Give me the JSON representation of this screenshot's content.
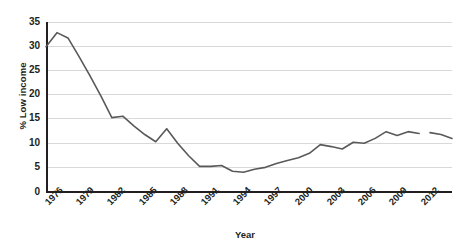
{
  "chart_data": {
    "type": "line",
    "title": "",
    "xlabel": "Year",
    "ylabel": "% Low income",
    "xlim": [
      1976,
      2013
    ],
    "ylim": [
      0,
      35
    ],
    "grid": true,
    "legend_position": "none",
    "y_ticks": [
      "0",
      "5",
      "10",
      "15",
      "20",
      "25",
      "30",
      "35"
    ],
    "x_ticks": [
      "1976",
      "1979",
      "1982",
      "1985",
      "1988",
      "1991",
      "1994",
      "1997",
      "2000",
      "2003",
      "2006",
      "2009",
      "2012"
    ],
    "series": [
      {
        "name": "% Low income",
        "color": "#595959",
        "x": [
          1976,
          1977,
          1978,
          1979,
          1980,
          1981,
          1982,
          1983,
          1984,
          1985,
          1986,
          1987,
          1988,
          1989,
          1990,
          1991,
          1992,
          1993,
          1994,
          1995,
          1996,
          1997,
          1998,
          1999,
          2000,
          2001,
          2002,
          2003,
          2004,
          2005,
          2006,
          2007,
          2008,
          2009,
          2010
        ],
        "values": [
          30.0,
          32.9,
          31.8,
          28.0,
          24.0,
          19.8,
          15.3,
          15.6,
          13.6,
          11.8,
          10.3,
          13.0,
          10.0,
          7.4,
          5.2,
          5.2,
          5.4,
          4.2,
          4.0,
          4.6,
          5.0,
          5.8,
          6.4,
          7.0,
          7.9,
          9.7,
          9.3,
          8.8,
          10.2,
          10.0,
          11.0,
          12.4,
          11.6,
          12.4,
          12.0
        ]
      },
      {
        "name": "% Low income (break segment)",
        "color": "#595959",
        "x": [
          2011,
          2012,
          2013
        ],
        "values": [
          12.2,
          11.8,
          11.0
        ]
      }
    ],
    "annotations": [
      "line has a small break/gap between 2010 and 2011"
    ]
  },
  "axes": {
    "y_title": "% Low income",
    "x_title": "Year"
  }
}
